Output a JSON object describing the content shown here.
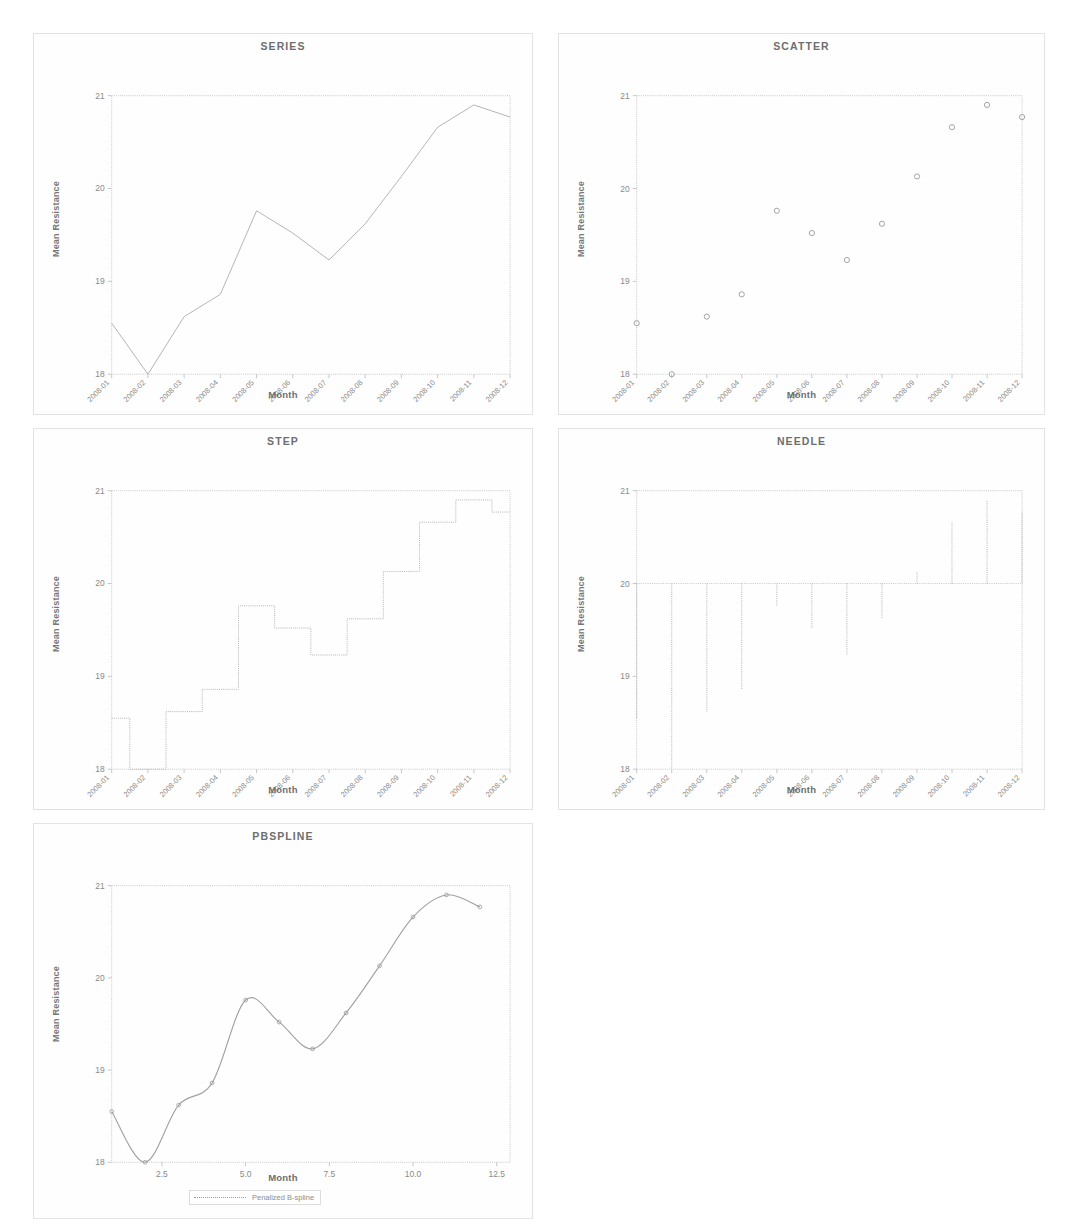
{
  "page": {
    "y_axis_label": "Mean Resistance",
    "x_axis_label": "Month",
    "month_categories": [
      "2008-01",
      "2008-02",
      "2008-03",
      "2008-04",
      "2008-05",
      "2008-06",
      "2008-07",
      "2008-08",
      "2008-09",
      "2008-10",
      "2008-11",
      "2008-12"
    ],
    "y_ticks": [
      "18",
      "19",
      "20",
      "21"
    ],
    "line_color": "#b4b4b4",
    "marker_color": "#9a9a9a",
    "axis_color": "#c8c8c8",
    "title_color": "#6e6e6e"
  },
  "chart_data": [
    {
      "type": "line",
      "title": "SERIES",
      "xlabel": "Month",
      "ylabel": "Mean Resistance",
      "categories": [
        "2008-01",
        "2008-02",
        "2008-03",
        "2008-04",
        "2008-05",
        "2008-06",
        "2008-07",
        "2008-08",
        "2008-09",
        "2008-10",
        "2008-11",
        "2008-12"
      ],
      "values": [
        18.55,
        18.0,
        18.62,
        18.86,
        19.76,
        19.52,
        19.23,
        19.62,
        20.13,
        20.66,
        20.9,
        20.77
      ],
      "ylim": [
        18,
        21
      ],
      "yticks": [
        18,
        19,
        20,
        21
      ],
      "grid": false,
      "legend": "none"
    },
    {
      "type": "scatter",
      "title": "SCATTER",
      "xlabel": "Month",
      "ylabel": "Mean Resistance",
      "categories": [
        "2008-01",
        "2008-02",
        "2008-03",
        "2008-04",
        "2008-05",
        "2008-06",
        "2008-07",
        "2008-08",
        "2008-09",
        "2008-10",
        "2008-11",
        "2008-12"
      ],
      "values": [
        18.55,
        18.0,
        18.62,
        18.86,
        19.76,
        19.52,
        19.23,
        19.62,
        20.13,
        20.66,
        20.9,
        20.77
      ],
      "ylim": [
        18,
        21
      ],
      "yticks": [
        18,
        19,
        20,
        21
      ],
      "marker": "circle",
      "grid": false,
      "legend": "none"
    },
    {
      "type": "step",
      "title": "STEP",
      "xlabel": "Month",
      "ylabel": "Mean Resistance",
      "categories": [
        "2008-01",
        "2008-02",
        "2008-03",
        "2008-04",
        "2008-05",
        "2008-06",
        "2008-07",
        "2008-08",
        "2008-09",
        "2008-10",
        "2008-11",
        "2008-12"
      ],
      "values": [
        18.55,
        18.0,
        18.62,
        18.86,
        19.76,
        19.52,
        19.23,
        19.62,
        20.13,
        20.66,
        20.9,
        20.77
      ],
      "ylim": [
        18,
        21
      ],
      "yticks": [
        18,
        19,
        20,
        21
      ],
      "grid": false,
      "legend": "none"
    },
    {
      "type": "needle",
      "title": "NEEDLE",
      "xlabel": "Month",
      "ylabel": "Mean Resistance",
      "categories": [
        "2008-01",
        "2008-02",
        "2008-03",
        "2008-04",
        "2008-05",
        "2008-06",
        "2008-07",
        "2008-08",
        "2008-09",
        "2008-10",
        "2008-11",
        "2008-12"
      ],
      "values": [
        18.55,
        18.0,
        18.62,
        18.86,
        19.76,
        19.52,
        19.23,
        19.62,
        20.13,
        20.66,
        20.9,
        20.77
      ],
      "baseline": 20,
      "ylim": [
        18,
        21
      ],
      "yticks": [
        18,
        19,
        20,
        21
      ],
      "grid": false,
      "legend": "none"
    },
    {
      "type": "line",
      "title": "PBSPLINE",
      "xlabel": "Month",
      "ylabel": "Mean Resistance",
      "x": [
        1,
        2,
        3,
        4,
        5,
        6,
        7,
        8,
        9,
        10,
        11,
        12
      ],
      "values": [
        18.55,
        18.0,
        18.62,
        18.86,
        19.76,
        19.52,
        19.23,
        19.62,
        20.13,
        20.66,
        20.9,
        20.77
      ],
      "xticks": [
        "2.5",
        "5.0",
        "7.5",
        "10.0",
        "12.5"
      ],
      "xtick_values": [
        2.5,
        5.0,
        7.5,
        10.0,
        12.5
      ],
      "xlim": [
        1,
        12.9
      ],
      "ylim": [
        18,
        21
      ],
      "yticks": [
        18,
        19,
        20,
        21
      ],
      "grid": false,
      "legend": {
        "position": "bottom",
        "entries": [
          {
            "label": "Penalized B-spline",
            "style": "line"
          }
        ]
      }
    }
  ]
}
